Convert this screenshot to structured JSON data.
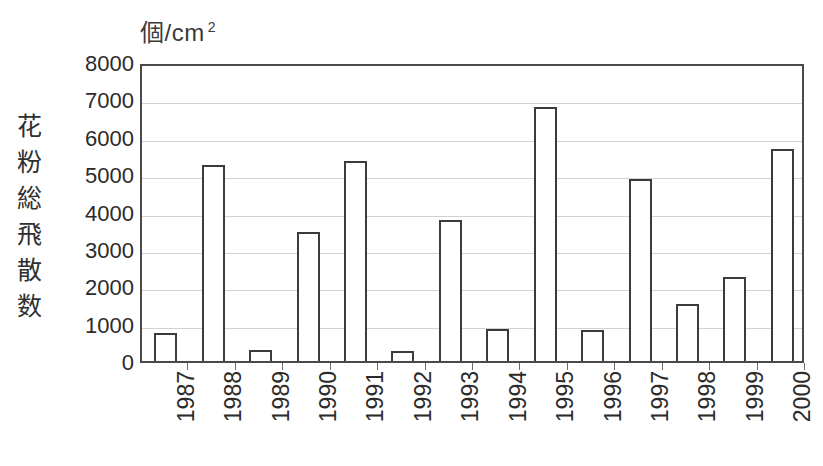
{
  "chart_data": {
    "type": "bar",
    "title": "",
    "subtitle": "",
    "unit_label": "個/cm",
    "unit_superscript": "2",
    "ylabel": "花粉総飛散数",
    "xlabel": "",
    "categories": [
      "1987",
      "1988",
      "1989",
      "1990",
      "1991",
      "1992",
      "1993",
      "1994",
      "1995",
      "1996",
      "1997",
      "1998",
      "1999",
      "2000"
    ],
    "values": [
      750,
      5250,
      300,
      3450,
      5350,
      280,
      3780,
      850,
      6800,
      820,
      4870,
      1520,
      2250,
      5680
    ],
    "ylim": [
      0,
      8000
    ],
    "ytick_values": [
      8000,
      7000,
      6000,
      5000,
      4000,
      3000,
      2000,
      1000,
      0
    ],
    "ytick_labels": [
      "8000",
      "7000",
      "6000",
      "5000",
      "4000",
      "3000",
      "2000",
      "1000",
      "0"
    ],
    "grid": true,
    "legend": "none",
    "bar_fill_color": "#ffffff",
    "bar_border_color": "#3b3b3b",
    "gridline_color": "#d2d2d2",
    "axis_color": "#4a4a4a",
    "text_color": "#2b2b2b",
    "background_color": "#ffffff"
  },
  "ylabel_chars": [
    "花",
    "粉",
    "総",
    "飛",
    "散",
    "数"
  ]
}
